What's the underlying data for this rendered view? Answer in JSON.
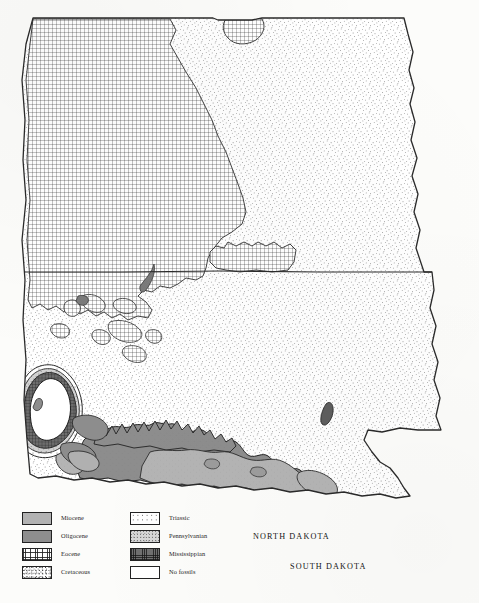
{
  "document": {
    "type": "geologic-map",
    "region": "North Dakota and South Dakota",
    "background_color": "#fcfcfa"
  },
  "map": {
    "states": [
      {
        "name": "NORTH DAKOTA",
        "label_x": 253,
        "label_y": 532
      },
      {
        "name": "SOUTH DAKOTA",
        "label_x": 290,
        "label_y": 562
      }
    ],
    "outline_color": "#2a2a2a",
    "state_border_y": 272
  },
  "legend": {
    "columns": [
      {
        "name": "cenozoic-column",
        "items": [
          {
            "label": "Miocene",
            "pattern": "solid-light-gray",
            "color": "#b2b2b2"
          },
          {
            "label": "Oligocene",
            "pattern": "solid-mid-gray",
            "color": "#8e8e8e"
          },
          {
            "label": "Eocene",
            "pattern": "fine-cross-hatch",
            "color": "#ffffff"
          },
          {
            "label": "Cretaceous",
            "pattern": "fine-stipple",
            "color": "#ffffff"
          }
        ]
      },
      {
        "name": "mesozoic-paleozoic-column",
        "items": [
          {
            "label": "Triassic",
            "pattern": "sparse-dots",
            "color": "#ffffff"
          },
          {
            "label": "Pennsylvanian",
            "pattern": "light-stipple",
            "color": "#d6d6d6"
          },
          {
            "label": "Mississippian",
            "pattern": "dark-grid",
            "color": "#6f6f6f"
          },
          {
            "label": "No fossils",
            "pattern": "blank-white",
            "color": "#ffffff"
          }
        ]
      }
    ]
  }
}
